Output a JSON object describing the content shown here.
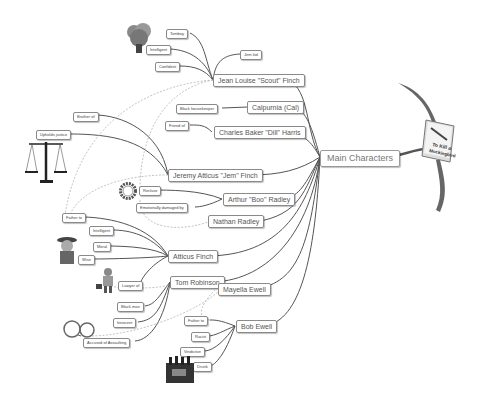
{
  "central": {
    "label": "Main Characters",
    "book_icon": "to-kill-a-mockingbird-book-icon",
    "book_title": "To Kill a Mockingbird"
  },
  "characters": [
    {
      "id": "scout",
      "label": "Jean Louise \"Scout\" Finch",
      "traits": [
        "Tomboy",
        "Intelligent",
        "Confident",
        "Jem kid"
      ]
    },
    {
      "id": "calpurnia",
      "label": "Calpurnia (Cal)",
      "traits": [
        "Black housekeeper"
      ]
    },
    {
      "id": "dill",
      "label": "Charles Baker \"Dill\" Harris",
      "traits": [
        "Friend of"
      ]
    },
    {
      "id": "jem",
      "label": "Jeremy Atticus \"Jem\" Finch",
      "traits": [
        "Brother of",
        "Upholds justice"
      ]
    },
    {
      "id": "boo",
      "label": "Arthur \"Boo\" Radley",
      "traits": [
        "Recluse",
        "Emotionally damaged by"
      ]
    },
    {
      "id": "nathan",
      "label": "Nathan Radley",
      "traits": []
    },
    {
      "id": "atticus",
      "label": "Atticus Finch",
      "traits": [
        "Father to",
        "Intelligent",
        "Moral",
        "Wise"
      ]
    },
    {
      "id": "tom",
      "label": "Tom Robinson",
      "traits": [
        "Lawyer of",
        "Black man",
        "Innocent",
        "Accused of Assaulting"
      ]
    },
    {
      "id": "mayella",
      "label": "Mayella Ewell",
      "traits": []
    },
    {
      "id": "bob",
      "label": "Bob Ewell",
      "traits": [
        "Father to",
        "Racist",
        "Vindictive",
        "Drunk"
      ]
    }
  ],
  "icons": {
    "tree": "tree-icon",
    "scales": "scales-of-justice-icon",
    "ring": "ring-icon",
    "lawyer": "lawyer-icon",
    "businessman": "businessman-icon",
    "handcuffs": "handcuffs-icon",
    "beer": "beer-crate-icon"
  }
}
